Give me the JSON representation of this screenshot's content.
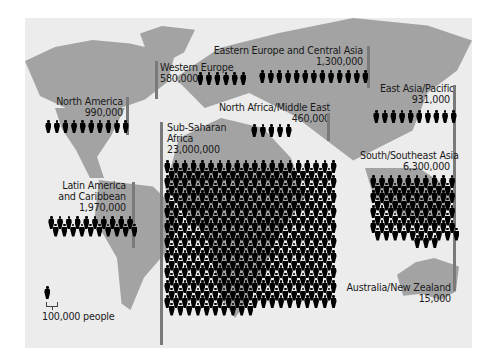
{
  "chart_data": {
    "type": "pictogram",
    "title": "",
    "unit": "100,000 people per figure",
    "legend": {
      "label": "100,000 people",
      "icon": "person-icon",
      "value_per_icon": 100000
    },
    "regions": [
      {
        "name": "North America",
        "value": 990000,
        "icons": 10
      },
      {
        "name": "Western Europe",
        "value": 580000,
        "icons": 6
      },
      {
        "name": "Eastern Europe and Central Asia",
        "value": 1300000,
        "icons": 13
      },
      {
        "name": "North Africa/Middle East",
        "value": 460000,
        "icons": 5
      },
      {
        "name": "East Asia/Pacific",
        "value": 931000,
        "icons": 10
      },
      {
        "name": "Sub-Saharan Africa",
        "value": 23000000,
        "icons": 230
      },
      {
        "name": "South/Southeast Asia",
        "value": 6300000,
        "icons": 63
      },
      {
        "name": "Latin America and Caribbean",
        "value": 1970000,
        "icons": 20
      },
      {
        "name": "Australia/New Zealand",
        "value": 15000,
        "icons": 0
      }
    ]
  },
  "labels": {
    "north_america": {
      "name": "North America",
      "value": "990,000"
    },
    "western_europe": {
      "name": "Western Europe",
      "value": "580,000"
    },
    "eastern_europe": {
      "name": "Eastern Europe and Central Asia",
      "value": "1,300,000"
    },
    "north_africa": {
      "name": "North Africa/Middle East",
      "value": "460,000"
    },
    "east_asia": {
      "name": "East Asia/Pacific",
      "value": "931,000"
    },
    "sub_saharan": {
      "name_line1": "Sub-Saharan",
      "name_line2": "Africa",
      "value": "23,000,000"
    },
    "south_asia": {
      "name": "South/Southeast Asia",
      "value": "6,300,000"
    },
    "latin_america": {
      "name_line1": "Latin America",
      "name_line2": "and Caribbean",
      "value": "1,970,000"
    },
    "australia": {
      "name": "Australia/New Zealand",
      "value": "15,000"
    }
  },
  "legend": {
    "label": "100,000 people"
  },
  "colors": {
    "ocean": "#ececec",
    "land": "#a3a3a3",
    "figure": "#000000",
    "bar": "#7a7a7a"
  }
}
